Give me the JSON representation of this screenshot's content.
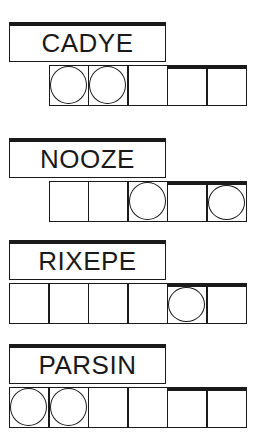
{
  "puzzle_type": "Jumble word scramble",
  "colors": {
    "ink": "#1a1a1a",
    "background": "#ffffff"
  },
  "puzzles": [
    {
      "scrambled": "CADYE",
      "cells": 5,
      "start_cell": 1,
      "circled": [
        0,
        1
      ]
    },
    {
      "scrambled": "NOOZE",
      "cells": 5,
      "start_cell": 1,
      "circled": [
        2,
        4
      ]
    },
    {
      "scrambled": "RIXEPE",
      "cells": 6,
      "start_cell": 0,
      "circled": [
        4
      ]
    },
    {
      "scrambled": "PARSIN",
      "cells": 6,
      "start_cell": 0,
      "circled": [
        0,
        1
      ]
    }
  ]
}
